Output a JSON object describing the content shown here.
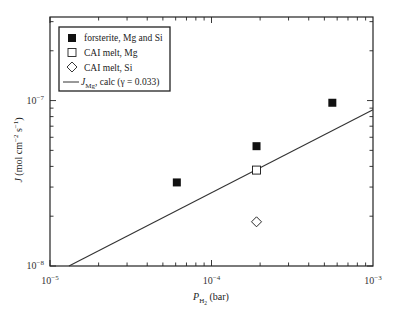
{
  "chart_data": {
    "type": "scatter",
    "title": "",
    "xlabel": "P_H2 (bar)",
    "xlabel_parts": {
      "main": "P",
      "sub": "H",
      "subsub": "2",
      "unit": " (bar)"
    },
    "ylabel": "J (mol cm^-2 s^-1)",
    "ylabel_parts": {
      "main": "J",
      "unit": " (mol cm",
      "exp1": "−2",
      "mid": " s",
      "exp2": "−1",
      "close": ")"
    },
    "xscale": "log",
    "yscale": "log",
    "xlim": [
      1e-05,
      0.001
    ],
    "ylim": [
      1e-08,
      3.2e-07
    ],
    "grid": false,
    "legend_position": "upper left",
    "x_ticks": [
      {
        "value": 1e-05,
        "base": "10",
        "exp": "−5"
      },
      {
        "value": 0.0001,
        "base": "10",
        "exp": "−4"
      },
      {
        "value": 0.001,
        "base": "10",
        "exp": "−3"
      }
    ],
    "y_ticks": [
      {
        "value": 1e-08,
        "base": "10",
        "exp": "−8"
      },
      {
        "value": 1e-07,
        "base": "10",
        "exp": "−7"
      }
    ],
    "series": [
      {
        "name": "forsterite, Mg and Si",
        "marker": "filled-square",
        "points": [
          {
            "x": 6.1e-05,
            "y": 3.2e-08
          },
          {
            "x": 0.00019,
            "y": 5.3e-08
          },
          {
            "x": 0.00056,
            "y": 9.7e-08
          }
        ]
      },
      {
        "name": "CAI melt, Mg",
        "marker": "open-square",
        "points": [
          {
            "x": 0.00019,
            "y": 3.8e-08
          }
        ]
      },
      {
        "name": "CAI melt, Si",
        "marker": "open-diamond",
        "points": [
          {
            "x": 0.00019,
            "y": 1.85e-08
          }
        ]
      },
      {
        "name": "J_Mg, calc (γ = 0.033)",
        "marker": "line",
        "points": [
          {
            "x": 1.31e-05,
            "y": 1e-08
          },
          {
            "x": 0.001,
            "y": 8.8e-08
          }
        ]
      }
    ],
    "legend": [
      {
        "label": "forsterite, Mg and Si",
        "marker": "filled-square"
      },
      {
        "label": "CAI melt, Mg",
        "marker": "open-square"
      },
      {
        "label": "CAI melt, Si",
        "marker": "open-diamond"
      },
      {
        "label_main": "J",
        "label_sub": "Mg",
        "label_rest": ", calc (γ = 0.033)",
        "marker": "line"
      }
    ]
  },
  "colors": {
    "axis": "#222222",
    "marker": "#111111",
    "line": "#333333",
    "background": "#ffffff"
  }
}
